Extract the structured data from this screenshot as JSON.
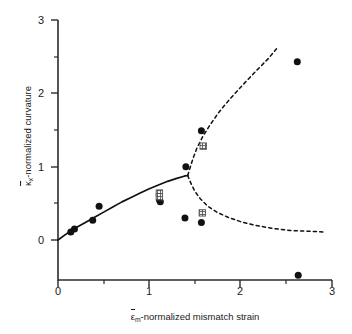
{
  "chart_data": {
    "type": "scatter",
    "title": "",
    "xlabel": "ε̄m-normalized mismatch strain",
    "ylabel": "κ̄x-normalized curvature",
    "xlim": [
      0,
      3
    ],
    "ylim": [
      -0.55,
      3
    ],
    "grid": false,
    "legend": "none",
    "xticks": [
      0,
      1,
      2,
      3
    ],
    "xtick_labels": [
      "0",
      "1",
      "2",
      "3"
    ],
    "xminor_ticks": [
      0.5,
      1.5,
      2.5
    ],
    "yticks": [
      0,
      1,
      2,
      3
    ],
    "ytick_labels": [
      "0",
      "1",
      "2",
      "3"
    ],
    "yminor_ticks": [
      0.5,
      1.5,
      2.5
    ],
    "axis_style": "left-and-bottom-spines, ticks outward",
    "series": [
      {
        "name": "experimental data (filled circles)",
        "marker": "filled-circle",
        "color": "#111111",
        "points": [
          [
            0.14,
            0.11
          ],
          [
            0.18,
            0.15
          ],
          [
            0.38,
            0.27
          ],
          [
            0.45,
            0.46
          ],
          [
            1.11,
            0.55
          ],
          [
            1.12,
            0.52
          ],
          [
            1.4,
            1.0
          ],
          [
            1.39,
            0.3
          ],
          [
            1.57,
            1.49
          ],
          [
            1.57,
            0.24
          ],
          [
            2.62,
            2.43
          ],
          [
            2.63,
            -0.48
          ]
        ]
      },
      {
        "name": "computed data (crosshatched squares)",
        "marker": "crosshatched-square",
        "color": "#555555",
        "points": [
          [
            1.11,
            0.64
          ],
          [
            1.11,
            0.59
          ],
          [
            1.59,
            1.28
          ],
          [
            1.58,
            0.37
          ]
        ]
      }
    ],
    "curves": [
      {
        "name": "stable branch (solid)",
        "style": "solid",
        "color": "#111111",
        "points": [
          [
            0.0,
            0.0
          ],
          [
            0.1,
            0.09
          ],
          [
            0.2,
            0.17
          ],
          [
            0.3,
            0.24
          ],
          [
            0.4,
            0.31
          ],
          [
            0.5,
            0.38
          ],
          [
            0.6,
            0.45
          ],
          [
            0.7,
            0.52
          ],
          [
            0.8,
            0.58
          ],
          [
            0.9,
            0.64
          ],
          [
            1.0,
            0.7
          ],
          [
            1.1,
            0.75
          ],
          [
            1.2,
            0.8
          ],
          [
            1.3,
            0.84
          ],
          [
            1.38,
            0.87
          ],
          [
            1.42,
            0.88
          ]
        ]
      },
      {
        "name": "upper unstable branch (dashed)",
        "style": "dashed",
        "color": "#111111",
        "points": [
          [
            1.42,
            0.88
          ],
          [
            1.45,
            1.0
          ],
          [
            1.48,
            1.12
          ],
          [
            1.52,
            1.25
          ],
          [
            1.58,
            1.4
          ],
          [
            1.66,
            1.56
          ],
          [
            1.76,
            1.74
          ],
          [
            1.88,
            1.92
          ],
          [
            2.02,
            2.11
          ],
          [
            2.18,
            2.32
          ],
          [
            2.3,
            2.47
          ],
          [
            2.4,
            2.62
          ]
        ]
      },
      {
        "name": "lower unstable branch (dashed)",
        "style": "dashed",
        "color": "#111111",
        "points": [
          [
            1.42,
            0.88
          ],
          [
            1.46,
            0.76
          ],
          [
            1.5,
            0.66
          ],
          [
            1.56,
            0.56
          ],
          [
            1.64,
            0.46
          ],
          [
            1.74,
            0.38
          ],
          [
            1.86,
            0.31
          ],
          [
            2.0,
            0.25
          ],
          [
            2.16,
            0.2
          ],
          [
            2.34,
            0.16
          ],
          [
            2.54,
            0.13
          ],
          [
            2.74,
            0.12
          ],
          [
            2.9,
            0.11
          ]
        ]
      }
    ]
  },
  "axis": {
    "x_title_symbol": "ε",
    "x_title_sub": "m",
    "x_title_rest": "-normalized mismatch strain",
    "y_title_symbol": "κ",
    "y_title_sub": "x",
    "y_title_rest": "-normalized curvature"
  }
}
